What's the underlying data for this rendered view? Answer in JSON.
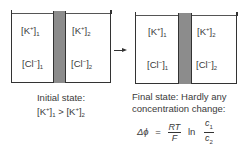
{
  "initial": {
    "left": {
      "k": "[K",
      "k_sup": "+",
      "k_close": "]",
      "k_sub": "1",
      "cl": "[Cl",
      "cl_sup": "−",
      "cl_close": "]",
      "cl_sub": "1"
    },
    "right": {
      "k": "[K",
      "k_sup": "+",
      "k_close": "]",
      "k_sub": "2",
      "cl": "[Cl",
      "cl_sup": "−",
      "cl_close": "]",
      "cl_sub": "2"
    },
    "caption_line1": "Initial state:",
    "caption_line2_a": "[K",
    "caption_line2_sup_a": "+",
    "caption_line2_close_a": "]",
    "caption_line2_sub_a": "1",
    "caption_line2_op": " > ",
    "caption_line2_b": "[K",
    "caption_line2_sup_b": "+",
    "caption_line2_close_b": "]",
    "caption_line2_sub_b": "2"
  },
  "final": {
    "left": {
      "k": "[K",
      "k_sup": "+",
      "k_close": "]",
      "k_sub": "1",
      "cl": "[Cl",
      "cl_sup": "−",
      "cl_close": "]",
      "cl_sub": "1"
    },
    "right": {
      "k": "[K",
      "k_sup": "+",
      "k_close": "]",
      "k_sub": "2",
      "cl": "[Cl",
      "cl_sup": "−",
      "cl_close": "]",
      "cl_sub": "2"
    },
    "caption_line1": "Final state: Hardly any",
    "caption_line2": "concentration change:"
  },
  "equation": {
    "lhs": "Δϕ",
    "equals": "=",
    "num1": "RT",
    "den1": "F",
    "ln": "ln",
    "num2": "c",
    "num2_sub": "1",
    "den2": "c",
    "den2_sub": "2"
  }
}
